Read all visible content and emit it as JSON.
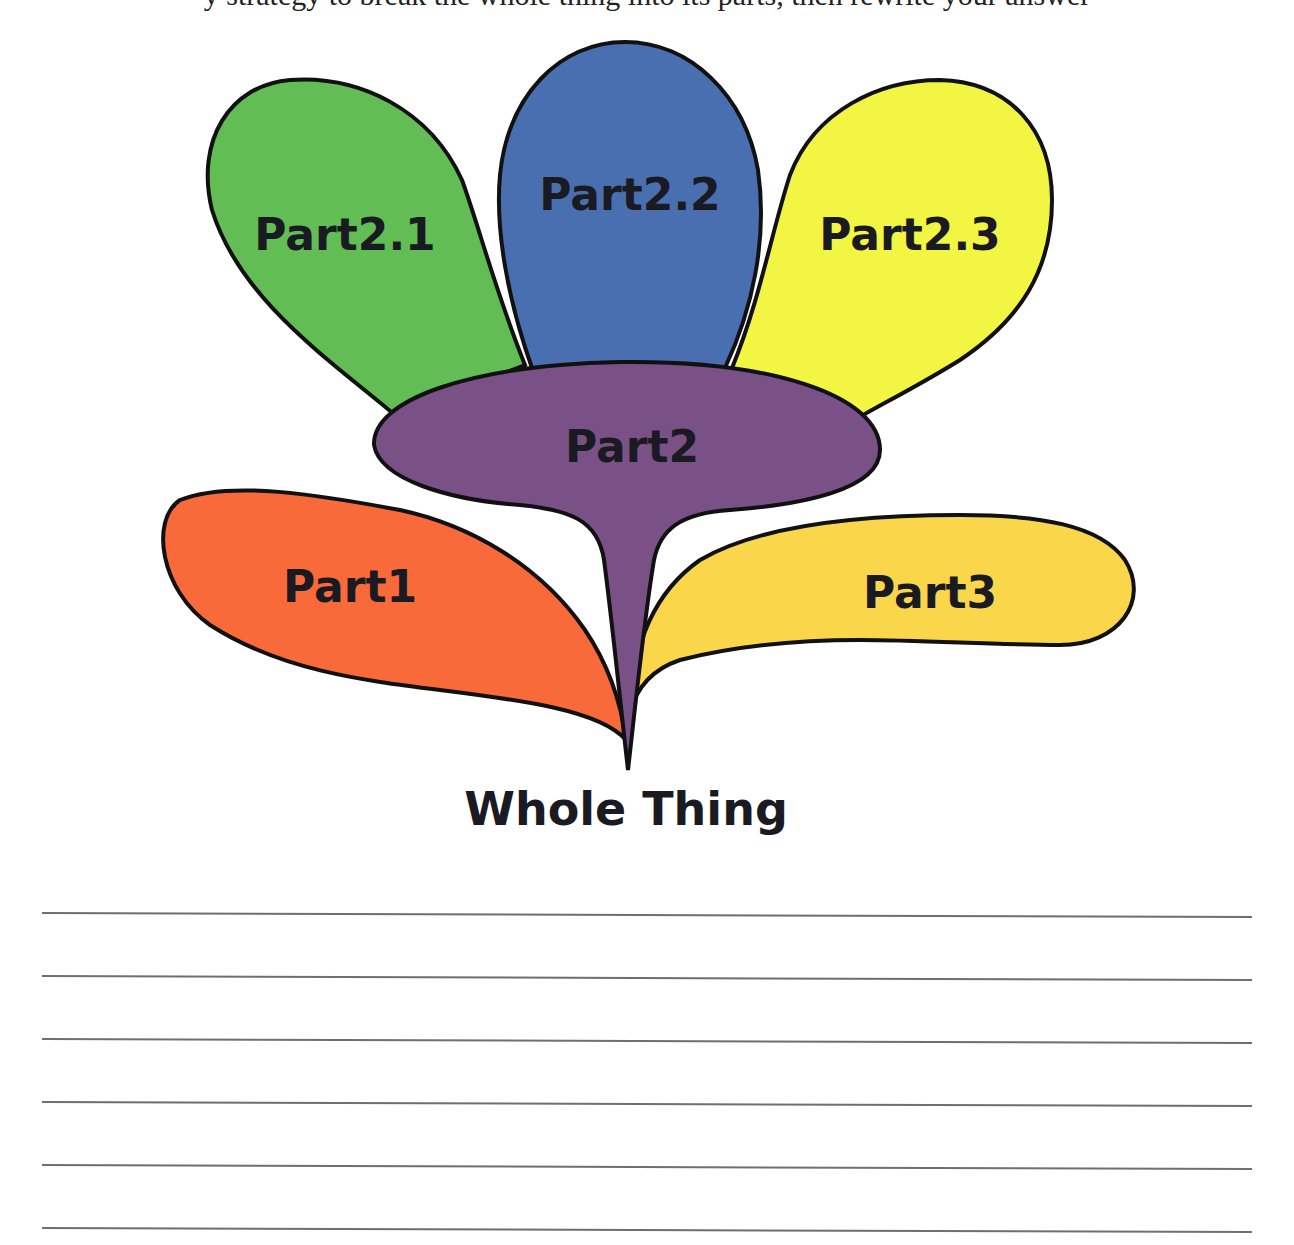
{
  "page": {
    "clipped_heading": "y strategy to break the whole thing into its parts, then rewrite your answer",
    "background": "#ffffff"
  },
  "diagram": {
    "type": "part-whole flower",
    "root": {
      "label": "Whole Thing"
    },
    "parts": [
      {
        "id": "part1",
        "label": "Part1",
        "color": "#f96a3a"
      },
      {
        "id": "part2",
        "label": "Part2",
        "color": "#7a5186",
        "children": [
          {
            "id": "part2_1",
            "label": "Part2.1",
            "color": "#62bd55"
          },
          {
            "id": "part2_2",
            "label": "Part2.2",
            "color": "#4a6fb0"
          },
          {
            "id": "part2_3",
            "label": "Part2.3",
            "color": "#f2f542"
          }
        ]
      },
      {
        "id": "part3",
        "label": "Part3",
        "color": "#f9d64a"
      }
    ],
    "outline_color": "#111111"
  },
  "writing_area": {
    "line_count": 6,
    "line_color": "#6f6f6f"
  }
}
